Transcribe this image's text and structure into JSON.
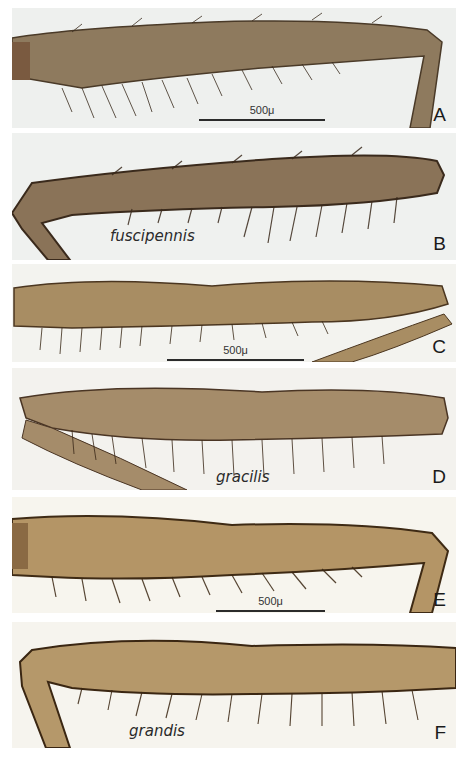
{
  "figure": {
    "panels": [
      {
        "id": "A",
        "letter": "A",
        "species": "",
        "scale_label": "500μ",
        "bg": "#eef0ee",
        "leg": "#8e7a5e",
        "edge": "#4a3a28"
      },
      {
        "id": "B",
        "letter": "B",
        "species": "fuscipennis",
        "scale_label": "",
        "bg": "#eff1ef",
        "leg": "#8a7358",
        "edge": "#3a2a1c"
      },
      {
        "id": "C",
        "letter": "C",
        "species": "",
        "scale_label": "500μ",
        "bg": "#f3f3ef",
        "leg": "#a88d63",
        "edge": "#4b3620"
      },
      {
        "id": "D",
        "letter": "D",
        "species": "gracilis",
        "scale_label": "",
        "bg": "#f3f2ee",
        "leg": "#a58c6a",
        "edge": "#4a3524"
      },
      {
        "id": "E",
        "letter": "E",
        "species": "",
        "scale_label": "500μ",
        "bg": "#f7f5ee",
        "leg": "#b49566",
        "edge": "#3e2a14"
      },
      {
        "id": "F",
        "letter": "F",
        "species": "grandis",
        "scale_label": "",
        "bg": "#f6f4ee",
        "leg": "#b5986a",
        "edge": "#3a2612"
      }
    ]
  }
}
